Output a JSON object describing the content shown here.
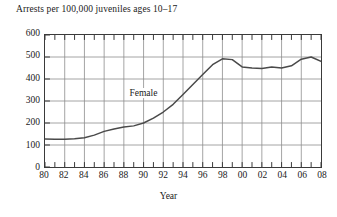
{
  "chart_data": {
    "type": "line",
    "title": "Arrests per 100,000 juveniles ages 10–17",
    "subtitle": "",
    "xlabel": "Year",
    "ylabel": "",
    "xlim": [
      1980,
      2008
    ],
    "ylim": [
      0,
      600
    ],
    "grid": true,
    "legend_position": "inline-annotation",
    "y_ticks": [
      0,
      100,
      200,
      300,
      400,
      500,
      600
    ],
    "y_tick_labels": [
      "0",
      "100",
      "200",
      "300",
      "400",
      "500",
      "600"
    ],
    "x_ticks": [
      1980,
      1982,
      1984,
      1986,
      1988,
      1990,
      1992,
      1994,
      1996,
      1998,
      2000,
      2002,
      2004,
      2006,
      2008
    ],
    "x_tick_labels": [
      "80",
      "82",
      "84",
      "86",
      "88",
      "90",
      "92",
      "94",
      "96",
      "98",
      "00",
      "02",
      "04",
      "06",
      "08"
    ],
    "x_minor_ticks_every": 1,
    "annotations": [
      {
        "text": "Female",
        "x": 1988.5,
        "y": 330
      }
    ],
    "series": [
      {
        "name": "Female",
        "color": "#4a4a4a",
        "x": [
          1980,
          1981,
          1982,
          1983,
          1984,
          1985,
          1986,
          1987,
          1988,
          1989,
          1990,
          1991,
          1992,
          1993,
          1994,
          1995,
          1996,
          1997,
          1998,
          1999,
          2000,
          2001,
          2002,
          2003,
          2004,
          2005,
          2006,
          2007,
          2008
        ],
        "values": [
          127,
          126,
          126,
          128,
          133,
          145,
          162,
          173,
          182,
          187,
          200,
          222,
          250,
          285,
          330,
          375,
          420,
          465,
          492,
          488,
          455,
          450,
          448,
          455,
          450,
          460,
          490,
          500,
          480
        ]
      }
    ]
  }
}
